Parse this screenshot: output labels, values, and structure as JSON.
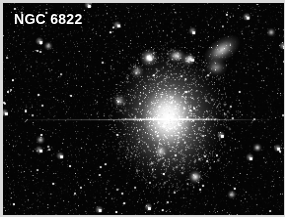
{
  "figure": {
    "label": "NGC 6822",
    "label_color": "#ffffff",
    "border_color": "#d9d9d9",
    "sky_color": "#040404",
    "width": 285,
    "height": 217
  },
  "image_data": {
    "type": "astronomical-image",
    "object_name": "NGC 6822",
    "field": {
      "background_color": "#040404",
      "star_count": 2600,
      "faint_star_color": "#c8c8c8",
      "bright_star_color": "#ffffff"
    },
    "galaxy": {
      "name": "NGC 6822",
      "morphology": "irregular",
      "center_x": 168,
      "center_y": 118,
      "radius_x": 62,
      "radius_y": 76,
      "core_x": 167,
      "core_y": 117,
      "core_radius": 26,
      "halo_color": "#b4b4b4",
      "core_color": "#ffffff",
      "member_star_count": 1500
    },
    "artifacts": {
      "bleed_line": {
        "name": "horizontal-bleed-line",
        "y": 119,
        "x_start": 20,
        "x_end": 268,
        "color": "#cfcfcf"
      }
    },
    "bright_knots": [
      {
        "name": "hii-region-upper-right",
        "x": 222,
        "y": 48,
        "rx": 9,
        "ry": 5,
        "angle": -35,
        "brightness": 0.78
      },
      {
        "name": "hii-region-right",
        "x": 216,
        "y": 66,
        "rx": 5,
        "ry": 4,
        "angle": 0,
        "brightness": 0.55
      },
      {
        "name": "knot-top-left",
        "x": 148,
        "y": 56,
        "rx": 4,
        "ry": 4,
        "angle": 0,
        "brightness": 0.85
      },
      {
        "name": "knot-top-mid",
        "x": 176,
        "y": 54,
        "rx": 4,
        "ry": 3,
        "angle": 0,
        "brightness": 0.9
      },
      {
        "name": "knot-top-right",
        "x": 188,
        "y": 58,
        "rx": 3,
        "ry": 3,
        "angle": 0,
        "brightness": 0.7
      },
      {
        "name": "knot-upper-left",
        "x": 136,
        "y": 70,
        "rx": 3,
        "ry": 3,
        "angle": 0,
        "brightness": 0.6
      },
      {
        "name": "knot-left-edge",
        "x": 118,
        "y": 100,
        "rx": 3,
        "ry": 3,
        "angle": 0,
        "brightness": 0.62
      },
      {
        "name": "knot-lower-mid",
        "x": 160,
        "y": 152,
        "rx": 3,
        "ry": 3,
        "angle": 0,
        "brightness": 0.6
      },
      {
        "name": "star-bottom-bright",
        "x": 195,
        "y": 178,
        "rx": 3,
        "ry": 3,
        "angle": 0,
        "brightness": 1.0
      },
      {
        "name": "star-right-field",
        "x": 258,
        "y": 148,
        "rx": 2,
        "ry": 2,
        "angle": 0,
        "brightness": 0.9
      },
      {
        "name": "star-left-field",
        "x": 38,
        "y": 140,
        "rx": 2,
        "ry": 2,
        "angle": 0,
        "brightness": 0.8
      },
      {
        "name": "star-upper-left-field",
        "x": 46,
        "y": 44,
        "rx": 2,
        "ry": 2,
        "angle": 0,
        "brightness": 0.75
      },
      {
        "name": "star-bottom-right",
        "x": 232,
        "y": 196,
        "rx": 2,
        "ry": 2,
        "angle": 0,
        "brightness": 0.85
      },
      {
        "name": "star-top-right",
        "x": 272,
        "y": 30,
        "rx": 2,
        "ry": 2,
        "angle": 0,
        "brightness": 0.8
      }
    ]
  }
}
